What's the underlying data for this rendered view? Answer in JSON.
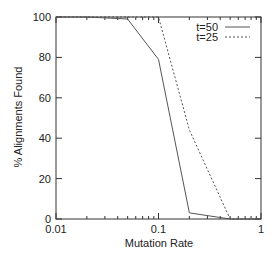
{
  "chart_data": {
    "type": "line",
    "title": "",
    "xlabel": "Mutation Rate",
    "ylabel": "% Alignments Found",
    "xscale": "log",
    "xlim": [
      0.01,
      1
    ],
    "ylim": [
      0,
      100
    ],
    "x_ticks": [
      0.01,
      0.1,
      1
    ],
    "x_tick_labels": [
      "0.01",
      "0.1",
      "1"
    ],
    "y_ticks": [
      0,
      20,
      40,
      60,
      80,
      100
    ],
    "y_tick_labels": [
      "0",
      "20",
      "40",
      "60",
      "80",
      "100"
    ],
    "grid": false,
    "legend_position": "upper right",
    "x": [
      0.01,
      0.02,
      0.05,
      0.1,
      0.2,
      0.5,
      1
    ],
    "series": [
      {
        "name": "t=50",
        "style": "solid",
        "values": [
          100,
          100,
          99,
          79,
          3,
          0,
          0
        ]
      },
      {
        "name": "t=25",
        "style": "dotted",
        "values": [
          100,
          100,
          100,
          100,
          44,
          0,
          0
        ]
      }
    ]
  },
  "colors": {
    "axis": "#333333",
    "line": "#555555",
    "text": "#222222"
  }
}
